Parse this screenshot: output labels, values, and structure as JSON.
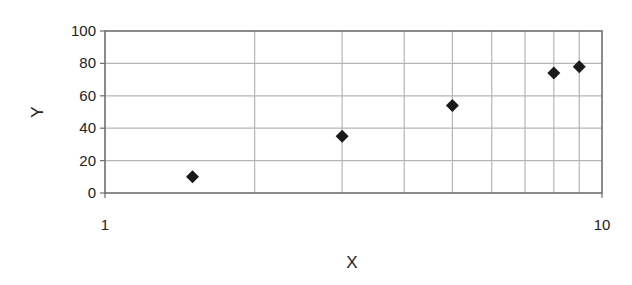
{
  "chart_data": {
    "type": "scatter",
    "title": "",
    "xlabel": "X",
    "ylabel": "Y",
    "xscale": "log",
    "xlim": [
      1,
      10
    ],
    "ylim": [
      0,
      100
    ],
    "x_ticks": [
      1,
      10
    ],
    "x_tick_labels": [
      "1",
      "10"
    ],
    "x_minor_gridlines": [
      2,
      3,
      4,
      5,
      6,
      7,
      8,
      9
    ],
    "y_ticks": [
      0,
      20,
      40,
      60,
      80,
      100
    ],
    "y_tick_labels": [
      "0",
      "20",
      "40",
      "60",
      "80",
      "100"
    ],
    "grid": true,
    "legend": null,
    "marker": "diamond",
    "series": [
      {
        "name": "Series 1",
        "x": [
          1.5,
          3,
          5,
          8,
          9
        ],
        "y": [
          10,
          35,
          54,
          74,
          78
        ]
      }
    ]
  },
  "colors": {
    "marker": "#1a1a1a",
    "axis": "#6e6e6e",
    "grid": "#b5b5b5",
    "text": "#222222"
  }
}
